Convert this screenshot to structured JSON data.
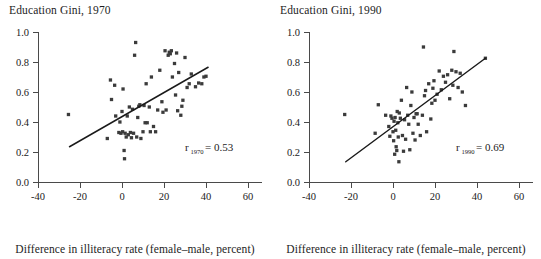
{
  "figure": {
    "background": "#ffffff",
    "point_color": "#3b3b3b",
    "axis_color": "#4a4a4a",
    "line_color": "#1a1a1a"
  },
  "panels": [
    {
      "id": "left",
      "title": "Education Gini, 1970",
      "caption": "Difference in illiteracy rate (female–male, percent)",
      "annotation": {
        "symbol": "r",
        "subscript": "1970",
        "equals": "=",
        "value": "0.53"
      }
    },
    {
      "id": "right",
      "title": "Education Gini, 1990",
      "caption": "Difference in illiteracy rate (female–male, percent)",
      "annotation": {
        "symbol": "r",
        "subscript": "1990",
        "equals": "=",
        "value": "0.69"
      }
    }
  ],
  "chart_data": [
    {
      "type": "scatter",
      "title": "Education Gini, 1970",
      "xlabel": "Difference in illiteracy rate (female–male, percent)",
      "ylabel": "",
      "xlim": [
        -40,
        60
      ],
      "ylim": [
        0.0,
        1.0
      ],
      "xticks": [
        -40,
        -20,
        0,
        20,
        40,
        60
      ],
      "xticklabels": [
        "-40",
        "-20",
        "0",
        "20",
        "40",
        "60"
      ],
      "yticks": [
        0.0,
        0.2,
        0.4,
        0.6,
        0.8,
        1.0
      ],
      "yticklabels": [
        "0.0",
        "0.2",
        "0.4",
        "0.6",
        "0.8",
        "1.0"
      ],
      "grid": false,
      "legend": null,
      "annotation_text": "r1970 = 0.53",
      "correlation": 0.53,
      "trendline": {
        "x": [
          -25,
          41
        ],
        "y": [
          0.235,
          0.765
        ]
      },
      "points": [
        [
          -25.5,
          0.45
        ],
        [
          -7.0,
          0.29
        ],
        [
          -5.5,
          0.68
        ],
        [
          -5.0,
          0.55
        ],
        [
          -3.5,
          0.645
        ],
        [
          -3.0,
          0.44
        ],
        [
          -1.5,
          0.33
        ],
        [
          -1.0,
          0.4
        ],
        [
          -0.5,
          0.325
        ],
        [
          0.0,
          0.47
        ],
        [
          0.3,
          0.335
        ],
        [
          0.5,
          0.62
        ],
        [
          1.0,
          0.21
        ],
        [
          1.2,
          0.155
        ],
        [
          1.5,
          0.325
        ],
        [
          2.0,
          0.3
        ],
        [
          2.5,
          0.44
        ],
        [
          3.0,
          0.315
        ],
        [
          3.5,
          0.5
        ],
        [
          4.0,
          0.33
        ],
        [
          4.5,
          0.295
        ],
        [
          5.0,
          0.485
        ],
        [
          5.5,
          0.325
        ],
        [
          6.0,
          0.845
        ],
        [
          6.5,
          0.93
        ],
        [
          7.0,
          0.3
        ],
        [
          7.5,
          0.43
        ],
        [
          8.0,
          0.505
        ],
        [
          8.5,
          0.515
        ],
        [
          9.0,
          0.29
        ],
        [
          10.0,
          0.335
        ],
        [
          10.5,
          0.51
        ],
        [
          11.0,
          0.395
        ],
        [
          11.5,
          0.655
        ],
        [
          12.0,
          0.395
        ],
        [
          13.0,
          0.5
        ],
        [
          13.5,
          0.335
        ],
        [
          14.0,
          0.7
        ],
        [
          15.0,
          0.37
        ],
        [
          16.0,
          0.335
        ],
        [
          17.0,
          0.48
        ],
        [
          18.0,
          0.745
        ],
        [
          19.0,
          0.535
        ],
        [
          19.5,
          0.465
        ],
        [
          20.5,
          0.875
        ],
        [
          21.0,
          0.48
        ],
        [
          22.0,
          0.845
        ],
        [
          22.5,
          0.865
        ],
        [
          23.0,
          0.855
        ],
        [
          23.5,
          0.875
        ],
        [
          24.0,
          0.7
        ],
        [
          25.0,
          0.79
        ],
        [
          25.5,
          0.58
        ],
        [
          26.0,
          0.86
        ],
        [
          26.5,
          0.475
        ],
        [
          27.0,
          0.73
        ],
        [
          28.0,
          0.445
        ],
        [
          28.5,
          0.505
        ],
        [
          29.0,
          0.545
        ],
        [
          30.0,
          0.83
        ],
        [
          31.0,
          0.63
        ],
        [
          32.0,
          0.655
        ],
        [
          33.0,
          0.72
        ],
        [
          35.0,
          0.635
        ],
        [
          36.5,
          0.66
        ],
        [
          38.0,
          0.655
        ],
        [
          39.0,
          0.7
        ],
        [
          40.0,
          0.705
        ]
      ]
    },
    {
      "type": "scatter",
      "title": "Education Gini, 1990",
      "xlabel": "Difference in illiteracy rate (female–male, percent)",
      "ylabel": "",
      "xlim": [
        -40,
        60
      ],
      "ylim": [
        0.0,
        1.0
      ],
      "xticks": [
        -40,
        -20,
        0,
        20,
        40,
        60
      ],
      "xticklabels": [
        "-40",
        "-20",
        "0",
        "20",
        "40",
        "60"
      ],
      "yticks": [
        0.0,
        0.2,
        0.4,
        0.6,
        0.8,
        1.0
      ],
      "yticklabels": [
        "0.0",
        "0.2",
        "0.4",
        "0.6",
        "0.8",
        "1.0"
      ],
      "grid": false,
      "legend": null,
      "annotation_text": "r1990 = 0.69",
      "correlation": 0.69,
      "trendline": {
        "x": [
          -22.5,
          44
        ],
        "y": [
          0.135,
          0.825
        ]
      },
      "points": [
        [
          -23.0,
          0.45
        ],
        [
          -8.5,
          0.325
        ],
        [
          -7.0,
          0.515
        ],
        [
          -3.5,
          0.445
        ],
        [
          -2.0,
          0.37
        ],
        [
          -1.5,
          0.305
        ],
        [
          -1.0,
          0.44
        ],
        [
          -0.5,
          0.425
        ],
        [
          0.0,
          0.335
        ],
        [
          0.3,
          0.275
        ],
        [
          0.5,
          0.405
        ],
        [
          0.8,
          0.185
        ],
        [
          1.0,
          0.43
        ],
        [
          1.3,
          0.345
        ],
        [
          1.5,
          0.235
        ],
        [
          1.8,
          0.21
        ],
        [
          2.0,
          0.47
        ],
        [
          2.3,
          0.395
        ],
        [
          2.5,
          0.3
        ],
        [
          2.8,
          0.135
        ],
        [
          3.0,
          0.46
        ],
        [
          3.5,
          0.425
        ],
        [
          4.0,
          0.545
        ],
        [
          4.5,
          0.31
        ],
        [
          5.0,
          0.205
        ],
        [
          5.5,
          0.415
        ],
        [
          6.0,
          0.285
        ],
        [
          6.5,
          0.63
        ],
        [
          7.0,
          0.445
        ],
        [
          7.5,
          0.385
        ],
        [
          8.0,
          0.215
        ],
        [
          8.5,
          0.51
        ],
        [
          9.0,
          0.6
        ],
        [
          9.5,
          0.325
        ],
        [
          10.0,
          0.43
        ],
        [
          10.5,
          0.28
        ],
        [
          11.0,
          0.455
        ],
        [
          11.5,
          0.455
        ],
        [
          12.0,
          0.385
        ],
        [
          13.0,
          0.31
        ],
        [
          14.0,
          0.445
        ],
        [
          14.5,
          0.9
        ],
        [
          15.0,
          0.575
        ],
        [
          15.5,
          0.61
        ],
        [
          16.0,
          0.335
        ],
        [
          17.0,
          0.655
        ],
        [
          18.0,
          0.42
        ],
        [
          18.5,
          0.525
        ],
        [
          19.0,
          0.625
        ],
        [
          19.5,
          0.675
        ],
        [
          20.0,
          0.545
        ],
        [
          21.0,
          0.585
        ],
        [
          22.0,
          0.74
        ],
        [
          23.0,
          0.615
        ],
        [
          24.0,
          0.705
        ],
        [
          25.0,
          0.665
        ],
        [
          26.0,
          0.715
        ],
        [
          27.0,
          0.555
        ],
        [
          28.0,
          0.745
        ],
        [
          28.5,
          0.645
        ],
        [
          29.0,
          0.87
        ],
        [
          30.0,
          0.735
        ],
        [
          31.0,
          0.63
        ],
        [
          32.0,
          0.725
        ],
        [
          33.0,
          0.6
        ],
        [
          34.5,
          0.51
        ],
        [
          44.0,
          0.825
        ]
      ]
    }
  ]
}
